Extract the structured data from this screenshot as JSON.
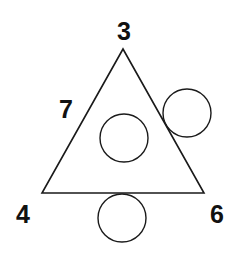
{
  "diagram": {
    "stroke_color": "#1a1a1a",
    "label_color": "#111111",
    "triangle": {
      "points": [
        [
          123,
          49
        ],
        [
          42,
          193
        ],
        [
          204,
          193
        ]
      ]
    },
    "labels": [
      {
        "id": "top",
        "text": "3",
        "x": 124,
        "y": 31
      },
      {
        "id": "left-side",
        "text": "7",
        "x": 66,
        "y": 109
      },
      {
        "id": "bottom-left",
        "text": "4",
        "x": 23,
        "y": 214
      },
      {
        "id": "bottom-right",
        "text": "6",
        "x": 217,
        "y": 214
      }
    ],
    "circles": [
      {
        "id": "inside-center",
        "cx": 124,
        "cy": 138,
        "r": 24
      },
      {
        "id": "outside-right",
        "cx": 187,
        "cy": 113,
        "r": 24
      },
      {
        "id": "below-bottom",
        "cx": 122,
        "cy": 218,
        "r": 24
      }
    ]
  }
}
